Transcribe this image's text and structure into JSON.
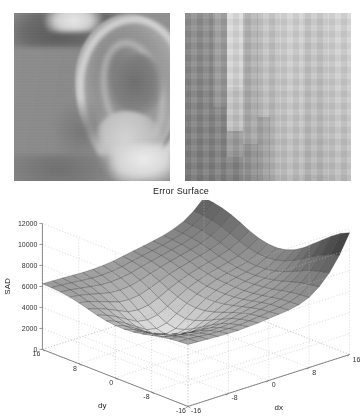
{
  "panels": [
    {
      "name": "source-image",
      "caption": "",
      "description": "grayscale photo of a human ear"
    },
    {
      "name": "zoomed-patch",
      "caption": "",
      "description": "magnified pixelated image patch with vertical intensity bands"
    }
  ],
  "chart_data": {
    "type": "surface",
    "title": "Error Surface",
    "xlabel": "dx",
    "ylabel": "dy",
    "zlabel": "SAD",
    "xticks": [
      -16,
      -8,
      0,
      8,
      16
    ],
    "yticks": [
      -16,
      -8,
      0,
      8,
      16
    ],
    "zticks": [
      0,
      2000,
      4000,
      6000,
      8000,
      10000,
      12000
    ],
    "xlim": [
      -16,
      16
    ],
    "ylim": [
      -16,
      16
    ],
    "zlim": [
      0,
      12000
    ],
    "grid": true,
    "legend": "none",
    "colormap": "gray",
    "x": [
      -16,
      -14,
      -12,
      -10,
      -8,
      -6,
      -4,
      -2,
      0,
      2,
      4,
      6,
      8,
      10,
      12,
      14,
      16
    ],
    "y": [
      -16,
      -14,
      -12,
      -10,
      -8,
      -6,
      -4,
      -2,
      0,
      2,
      4,
      6,
      8,
      10,
      12,
      14,
      16
    ],
    "z_description": "SAD block-matching error surface: broad ~5000-6000 plateau on the left, a deep valley near dx=0 dropping toward ~1500, a secondary ridge near dx=+4, and a steep peak rising to ~12000 at the far dx=+16 / dy=-16 corner",
    "z_min": 1500,
    "z_max": 12000,
    "z_plateau": 5500,
    "peak_at": {
      "dx": 16,
      "dy": -16,
      "value": 12000
    },
    "minimum_at": {
      "dx": 0,
      "dy": 4,
      "value": 1500
    },
    "values": [
      [
        5900,
        5850,
        5800,
        5750,
        5700,
        5700,
        5750,
        5800,
        5900,
        6000,
        6100,
        6300,
        6700,
        7400,
        8400,
        9800,
        11600
      ],
      [
        5850,
        5800,
        5700,
        5620,
        5560,
        5540,
        5580,
        5660,
        5780,
        5900,
        6020,
        6220,
        6600,
        7250,
        8200,
        9500,
        11200
      ],
      [
        5750,
        5650,
        5520,
        5400,
        5320,
        5300,
        5360,
        5480,
        5640,
        5800,
        5950,
        6150,
        6500,
        7100,
        7950,
        9100,
        10600
      ],
      [
        5600,
        5450,
        5280,
        5100,
        4980,
        4950,
        5030,
        5200,
        5420,
        5620,
        5800,
        6000,
        6320,
        6850,
        7600,
        8650,
        9900
      ],
      [
        5400,
        5200,
        4960,
        4700,
        4520,
        4480,
        4580,
        4820,
        5120,
        5380,
        5600,
        5820,
        6120,
        6560,
        7180,
        8100,
        9200
      ],
      [
        5200,
        4950,
        4620,
        4260,
        3980,
        3920,
        4060,
        4400,
        4800,
        5140,
        5420,
        5680,
        5980,
        6340,
        6820,
        7600,
        8500
      ],
      [
        5050,
        4750,
        4340,
        3860,
        3450,
        3360,
        3540,
        3980,
        4500,
        4940,
        5300,
        5600,
        5880,
        6180,
        6560,
        7200,
        7950
      ],
      [
        4980,
        4640,
        4160,
        3580,
        3040,
        2880,
        3100,
        3640,
        4280,
        4820,
        5240,
        5580,
        5840,
        6090,
        6400,
        6950,
        7600
      ],
      [
        5000,
        4640,
        4120,
        3480,
        2840,
        2620,
        2860,
        3480,
        4200,
        4800,
        5260,
        5620,
        5880,
        6090,
        6350,
        6850,
        7450
      ],
      [
        5100,
        4740,
        4230,
        3620,
        3020,
        2820,
        3040,
        3620,
        4300,
        4880,
        5320,
        5680,
        5940,
        6160,
        6420,
        6900,
        7500
      ],
      [
        5300,
        4980,
        4520,
        3980,
        3460,
        3300,
        3480,
        3980,
        4580,
        5100,
        5500,
        5840,
        6100,
        6340,
        6620,
        7100,
        7700
      ],
      [
        5550,
        5280,
        4900,
        4460,
        4040,
        3920,
        4060,
        4460,
        4960,
        5400,
        5760,
        6060,
        6320,
        6580,
        6900,
        7400,
        8050
      ],
      [
        5800,
        5600,
        5300,
        4960,
        4640,
        4560,
        4680,
        5000,
        5400,
        5760,
        6060,
        6320,
        6580,
        6860,
        7220,
        7780,
        8500
      ],
      [
        6000,
        5860,
        5650,
        5400,
        5180,
        5120,
        5220,
        5460,
        5780,
        6080,
        6340,
        6580,
        6820,
        7120,
        7520,
        8120,
        8900
      ],
      [
        6150,
        6050,
        5900,
        5740,
        5600,
        5560,
        5640,
        5820,
        6080,
        6320,
        6540,
        6760,
        6990,
        7300,
        7720,
        8360,
        9200
      ],
      [
        6220,
        6160,
        6070,
        5970,
        5890,
        5870,
        5930,
        6070,
        6280,
        6480,
        6670,
        6870,
        7090,
        7400,
        7830,
        8500,
        9400
      ],
      [
        6250,
        6220,
        6180,
        6130,
        6090,
        6090,
        6140,
        6250,
        6420,
        6600,
        6770,
        6950,
        7160,
        7470,
        7900,
        8580,
        9500
      ]
    ]
  }
}
